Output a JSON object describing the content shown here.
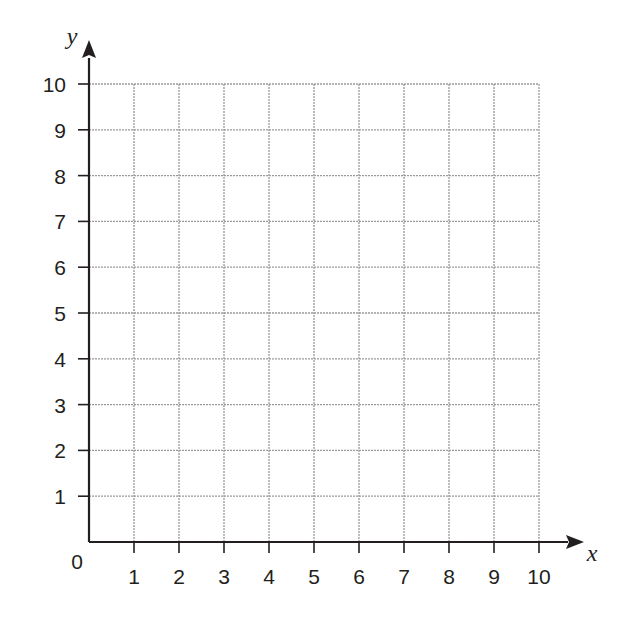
{
  "chart_data": {
    "type": "scatter",
    "title": "",
    "xlabel": "x",
    "ylabel": "y",
    "xlim": [
      0,
      10
    ],
    "ylim": [
      0,
      10
    ],
    "x_ticks": [
      1,
      2,
      3,
      4,
      5,
      6,
      7,
      8,
      9,
      10
    ],
    "y_ticks": [
      1,
      2,
      3,
      4,
      5,
      6,
      7,
      8,
      9,
      10
    ],
    "origin_label": "0",
    "grid": true,
    "grid_style": "dotted",
    "series": [],
    "legend": null
  },
  "colors": {
    "axis": "#231f20",
    "grid": "#9a9a9a",
    "text": "#231f20",
    "background": "#ffffff"
  }
}
